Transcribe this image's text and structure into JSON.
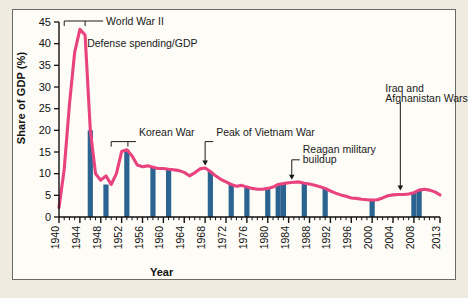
{
  "figure": {
    "background_color": "#efebe0",
    "card_color": "#fdfcf7",
    "border_color": "#6c6a62"
  },
  "axes": {
    "y_title": "Share of GDP (%)",
    "x_title": "Year"
  },
  "chart_data": {
    "type": "line",
    "title": "",
    "subtitle": "",
    "xlabel": "Year",
    "ylabel": "Share of GDP (%)",
    "xlim": [
      1940,
      2013
    ],
    "ylim": [
      0,
      45
    ],
    "ytick_step": 5,
    "yticks": [
      0,
      5,
      10,
      15,
      20,
      25,
      30,
      35,
      40,
      45
    ],
    "xticks": [
      1940,
      1944,
      1948,
      1952,
      1956,
      1960,
      1964,
      1968,
      1972,
      1976,
      1980,
      1984,
      1988,
      1992,
      1996,
      2000,
      2004,
      2008,
      2013
    ],
    "xtick_labels": [
      "1940",
      "1944",
      "1948",
      "1952",
      "1956",
      "1960",
      "1964",
      "1968",
      "1972",
      "1976",
      "1980",
      "1984",
      "1988",
      "1992",
      "1996",
      "2000",
      "2004",
      "2008",
      "2013"
    ],
    "minor_tick_step": 1,
    "grid": false,
    "legend": "none",
    "line_color": "#e8437e",
    "bar_color": "#2b6491",
    "series": [
      {
        "name": "Defense spending/GDP",
        "color": "#e8437e",
        "x": [
          1940,
          1941,
          1942,
          1943,
          1944,
          1945,
          1946,
          1947,
          1948,
          1949,
          1950,
          1951,
          1952,
          1953,
          1954,
          1955,
          1956,
          1957,
          1958,
          1959,
          1960,
          1961,
          1962,
          1963,
          1964,
          1965,
          1966,
          1967,
          1968,
          1969,
          1970,
          1971,
          1972,
          1973,
          1974,
          1975,
          1976,
          1977,
          1978,
          1979,
          1980,
          1981,
          1982,
          1983,
          1984,
          1985,
          1986,
          1987,
          1988,
          1989,
          1990,
          1991,
          1992,
          1993,
          1994,
          1995,
          1996,
          1997,
          1998,
          1999,
          2000,
          2001,
          2002,
          2003,
          2004,
          2005,
          2006,
          2007,
          2008,
          2009,
          2010,
          2011,
          2012,
          2013
        ],
        "y": [
          2.2,
          11.0,
          26.0,
          38.0,
          43.3,
          42.0,
          20.0,
          10.0,
          8.5,
          9.5,
          7.5,
          10.0,
          15.1,
          15.5,
          14.1,
          12.0,
          11.6,
          11.8,
          11.5,
          11.2,
          11.2,
          11.0,
          10.9,
          10.7,
          10.3,
          9.5,
          10.2,
          11.1,
          11.3,
          10.5,
          9.5,
          8.7,
          8.1,
          7.5,
          7.1,
          7.3,
          6.9,
          6.6,
          6.4,
          6.4,
          6.6,
          6.9,
          7.5,
          7.7,
          7.9,
          8.0,
          8.1,
          7.8,
          7.6,
          7.3,
          7.0,
          6.6,
          6.0,
          5.5,
          5.1,
          4.8,
          4.4,
          4.3,
          4.1,
          4.0,
          3.9,
          4.0,
          4.4,
          4.9,
          5.1,
          5.2,
          5.2,
          5.3,
          5.6,
          6.2,
          6.4,
          6.2,
          5.8,
          5.1
        ]
      }
    ],
    "war_bars": {
      "name": "War years",
      "color": "#2b6491",
      "description": "Vertical blue bars mark selected years",
      "years": [
        1946,
        1949,
        1953,
        1958,
        1961,
        1969,
        1973,
        1976,
        1980,
        1982,
        1983,
        1987,
        1991,
        2000,
        2008,
        2009
      ],
      "heights": [
        20.0,
        7.5,
        15.5,
        11.5,
        11.0,
        10.5,
        7.5,
        6.9,
        6.6,
        7.5,
        7.7,
        7.8,
        6.6,
        3.9,
        5.6,
        6.2
      ]
    },
    "annotations": [
      {
        "name": "world-war-ii",
        "text": "World War II",
        "type": "bracket",
        "span": [
          1941,
          1945
        ],
        "y": 45
      },
      {
        "name": "defense-spending-gdp",
        "text": "Defense spending/GDP",
        "type": "label",
        "x": 1946,
        "y": 40
      },
      {
        "name": "korean-war",
        "text": "Korean War",
        "type": "bracket",
        "span": [
          1950,
          1953
        ],
        "y": 17.5
      },
      {
        "name": "peak-of-vietnam-war",
        "text": "Peak of Vietnam War",
        "type": "arrow",
        "x": 1968,
        "y": 17.0
      },
      {
        "name": "reagan-military-buildup",
        "text": "Reagan military buildup",
        "type": "arrow",
        "x": 1985,
        "y": 13.0
      },
      {
        "name": "iraq-and-afghanistan-wars",
        "text": "Iraq and Afghanistan Wars",
        "type": "arrow",
        "x": 2005,
        "y": 27.0
      }
    ]
  },
  "annotation_text": {
    "wwii": "World War II",
    "defense": "Defense spending/GDP",
    "korean": "Korean War",
    "vietnam": "Peak of Vietnam War",
    "reagan_line1": "Reagan military",
    "reagan_line2": "buildup",
    "iraq_line1": "Iraq and",
    "iraq_line2": "Afghanistan Wars"
  },
  "ytick_labels": [
    "45",
    "40",
    "35",
    "30",
    "25",
    "20",
    "15",
    "10",
    "5",
    "0"
  ]
}
